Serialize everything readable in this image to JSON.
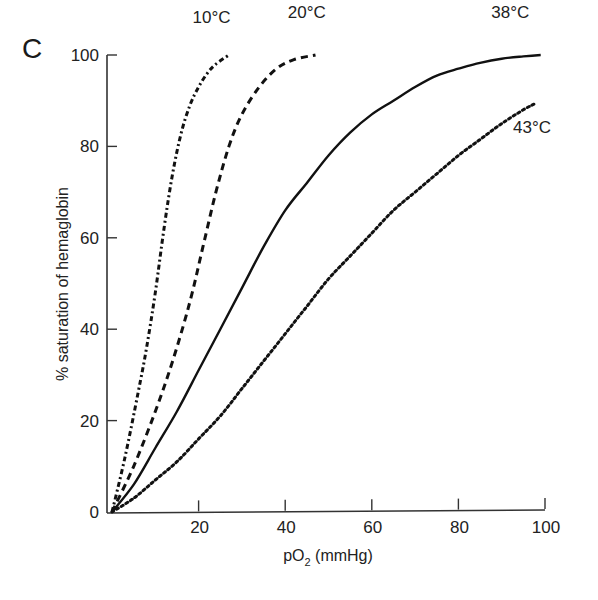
{
  "panel_label": "C",
  "chart_data": {
    "type": "line",
    "title": "",
    "xlabel": "pO2 (mmHg)",
    "xlabel_parts": {
      "main": "pO",
      "sub": "2",
      "rest": " (mmHg)"
    },
    "ylabel": "% saturation of hemaglobin",
    "xlim": [
      0,
      100
    ],
    "ylim": [
      0,
      100
    ],
    "x_ticks": [
      20,
      40,
      60,
      80,
      100
    ],
    "y_ticks": [
      0,
      20,
      40,
      60,
      80,
      100
    ],
    "x_tick_labels": [
      "20",
      "40",
      "60",
      "80",
      "100"
    ],
    "y_tick_labels": [
      "0",
      "20",
      "40",
      "60",
      "80",
      "100"
    ],
    "grid": false,
    "legend": "inline labels at curve ends",
    "series": [
      {
        "name": "10°C",
        "style": "dash-dot",
        "x": [
          0,
          3,
          6,
          8,
          10,
          12,
          14,
          16,
          18,
          20,
          22,
          24,
          27
        ],
        "y": [
          0,
          12,
          26,
          36,
          48,
          62,
          74,
          83,
          89,
          93,
          96,
          98,
          100
        ]
      },
      {
        "name": "20°C",
        "style": "dashed",
        "x": [
          0,
          5,
          10,
          14,
          18,
          21,
          24,
          27,
          30,
          34,
          38,
          42,
          47
        ],
        "y": [
          0,
          10,
          22,
          33,
          46,
          58,
          70,
          80,
          87,
          93,
          97,
          99,
          100
        ]
      },
      {
        "name": "38°C",
        "style": "solid",
        "x": [
          0,
          5,
          10,
          15,
          20,
          25,
          30,
          35,
          40,
          45,
          50,
          55,
          60,
          65,
          70,
          75,
          80,
          85,
          90,
          95,
          99
        ],
        "y": [
          0,
          6,
          14,
          22,
          31,
          40,
          49,
          58,
          66,
          72,
          78,
          83,
          87,
          90,
          93,
          95.5,
          97,
          98.3,
          99.2,
          99.7,
          100
        ]
      },
      {
        "name": "43°C",
        "style": "dotted",
        "x": [
          0,
          5,
          10,
          15,
          20,
          25,
          30,
          35,
          40,
          45,
          50,
          55,
          60,
          65,
          70,
          75,
          80,
          85,
          90,
          95,
          98
        ],
        "y": [
          0,
          3,
          7,
          11,
          16,
          21,
          27,
          33,
          39,
          45,
          51,
          56,
          61,
          66,
          70,
          74,
          78,
          81.5,
          85,
          88,
          89.5
        ]
      }
    ],
    "label_positions": [
      {
        "name": "10°C",
        "x": 23,
        "y": 107
      },
      {
        "name": "20°C",
        "x": 45,
        "y": 108
      },
      {
        "name": "38°C",
        "x": 92,
        "y": 108
      },
      {
        "name": "43°C",
        "x": 97,
        "y": 83
      }
    ]
  },
  "colors": {
    "line": "#111111",
    "axis": "#333333",
    "background": "#ffffff"
  }
}
